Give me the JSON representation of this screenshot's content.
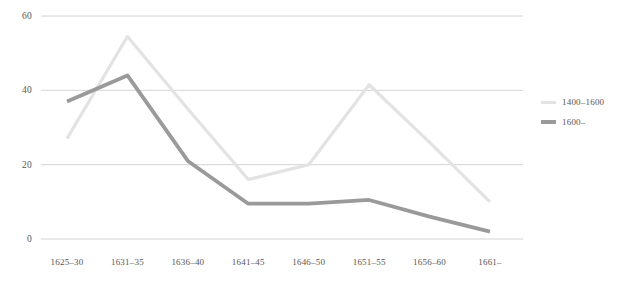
{
  "chart_data": {
    "type": "line",
    "title": "",
    "xlabel": "",
    "ylabel": "",
    "categories": [
      "1625–30",
      "1631–35",
      "1636–40",
      "1641–45",
      "1646–50",
      "1651–55",
      "1656–60",
      "1661–"
    ],
    "series": [
      {
        "name": "1400–1600",
        "color": "#e3e3e3",
        "values": [
          27,
          54.5,
          35,
          16,
          20,
          41.5,
          26,
          10
        ]
      },
      {
        "name": "1600–",
        "color": "#9a9a9a",
        "values": [
          37,
          44,
          21,
          9.5,
          9.5,
          10.5,
          6,
          2
        ]
      }
    ],
    "ylim": [
      0,
      60
    ],
    "yticks": [
      0,
      20,
      40,
      60
    ],
    "ytick_labels": [
      "0",
      "20",
      "40",
      "60"
    ],
    "grid": true,
    "grid_color": "#c9c9c9",
    "legend_position": "right"
  },
  "legend": {
    "entries": [
      {
        "label": "1400–1600"
      },
      {
        "label": "1600–"
      }
    ]
  }
}
